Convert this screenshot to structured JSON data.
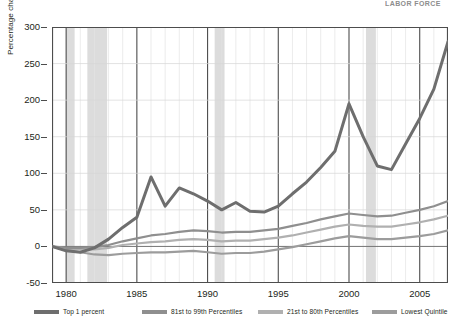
{
  "header": {
    "cut_text": "LABOR  FORCE"
  },
  "axes": {
    "y_title": "Percentage change in income since 1979, adjusted for inflation",
    "y_ticks": [
      300,
      250,
      200,
      150,
      100,
      50,
      0,
      -50
    ],
    "x_ticks": [
      1980,
      1985,
      1990,
      1995,
      2000,
      2005
    ]
  },
  "legend": {
    "items": [
      {
        "label": "Top 1 percent",
        "color": "#6e6e6e",
        "x": 0
      },
      {
        "label": "81st to 99th Percentiles",
        "color": "#8f8f8f",
        "x": 108
      },
      {
        "label": "21st to 80th Percentiles",
        "color": "#b0b0b0",
        "x": 224
      },
      {
        "label": "Lowest Quintile",
        "color": "#9c9c9c",
        "x": 338
      },
      {
        "label": "Recession",
        "color": "#d9d9d9",
        "x": 432
      }
    ]
  },
  "chart_data": {
    "type": "line",
    "title": "",
    "xlabel": "",
    "ylabel": "Percentage change in income since 1979, adjusted for inflation",
    "xlim": [
      1979,
      2007
    ],
    "ylim": [
      -50,
      300
    ],
    "grid": true,
    "legend_position": "bottom",
    "x": [
      1979,
      1980,
      1981,
      1982,
      1983,
      1984,
      1985,
      1986,
      1987,
      1988,
      1989,
      1990,
      1991,
      1992,
      1993,
      1994,
      1995,
      1996,
      1997,
      1998,
      1999,
      2000,
      2001,
      2002,
      2003,
      2004,
      2005,
      2006,
      2007
    ],
    "series": [
      {
        "name": "Top 1 percent",
        "color": "#6e6e6e",
        "values": [
          0,
          -6,
          -8,
          -2,
          10,
          26,
          40,
          95,
          55,
          80,
          72,
          62,
          50,
          60,
          48,
          47,
          55,
          72,
          88,
          108,
          130,
          195,
          150,
          110,
          105,
          140,
          175,
          215,
          280
        ]
      },
      {
        "name": "81st to 99th Percentiles",
        "color": "#8f8f8f",
        "values": [
          0,
          -2,
          -2,
          -1,
          2,
          7,
          11,
          15,
          17,
          20,
          22,
          21,
          19,
          20,
          20,
          22,
          24,
          28,
          32,
          37,
          41,
          45,
          43,
          41,
          42,
          46,
          50,
          55,
          62
        ]
      },
      {
        "name": "21st to 80th Percentiles",
        "color": "#b0b0b0",
        "values": [
          0,
          -3,
          -4,
          -4,
          -2,
          2,
          4,
          6,
          7,
          9,
          10,
          9,
          7,
          8,
          8,
          10,
          12,
          15,
          19,
          23,
          27,
          30,
          28,
          27,
          27,
          30,
          33,
          37,
          42
        ]
      },
      {
        "name": "Lowest Quintile",
        "color": "#9c9c9c",
        "values": [
          0,
          -5,
          -8,
          -11,
          -12,
          -10,
          -9,
          -8,
          -8,
          -7,
          -6,
          -8,
          -10,
          -9,
          -9,
          -7,
          -4,
          -1,
          3,
          7,
          11,
          14,
          12,
          10,
          10,
          12,
          14,
          17,
          22
        ]
      }
    ],
    "recessions": [
      {
        "start": 1980.0,
        "end": 1980.6
      },
      {
        "start": 1981.5,
        "end": 1982.9
      },
      {
        "start": 1990.5,
        "end": 1991.2
      },
      {
        "start": 2001.2,
        "end": 2001.9
      }
    ]
  }
}
